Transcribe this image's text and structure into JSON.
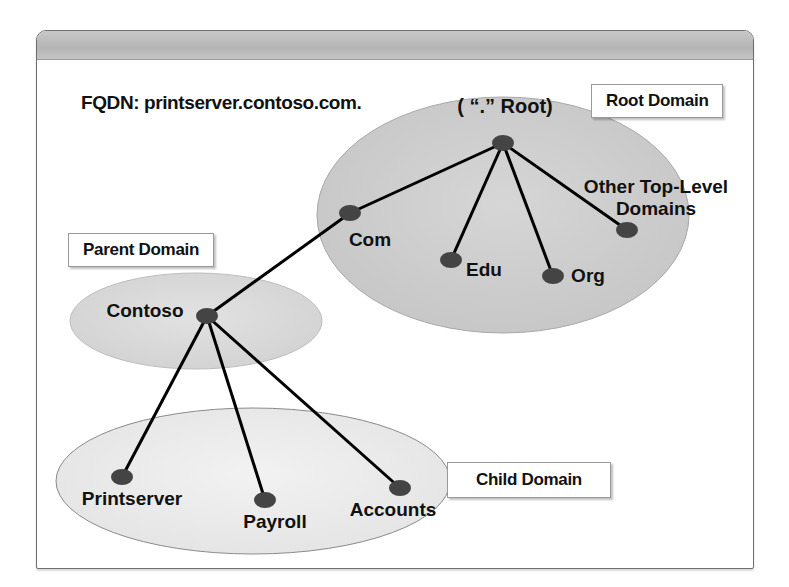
{
  "fqdn_label": "FQDN: printserver.contoso.com.",
  "tags": {
    "root_domain": "Root Domain",
    "parent_domain": "Parent Domain",
    "child_domain": "Child Domain"
  },
  "colors": {
    "root_ellipse": "#cfcfcf",
    "parent_ellipse": "#dcdcdc",
    "child_ellipse": "#ececec",
    "node": "#444444",
    "edge": "#000000",
    "header_bar": "#bdbdbd"
  },
  "nodes": [
    {
      "id": "root",
      "label": "( “.” Root)"
    },
    {
      "id": "com",
      "label": "Com"
    },
    {
      "id": "edu",
      "label": "Edu"
    },
    {
      "id": "org",
      "label": "Org"
    },
    {
      "id": "other",
      "label": "Other Top-Level",
      "label2": "Domains"
    },
    {
      "id": "contoso",
      "label": "Contoso"
    },
    {
      "id": "printserver",
      "label": "Printserver"
    },
    {
      "id": "payroll",
      "label": "Payroll"
    },
    {
      "id": "accounts",
      "label": "Accounts"
    }
  ],
  "edges": [
    [
      "root",
      "com"
    ],
    [
      "root",
      "edu"
    ],
    [
      "root",
      "org"
    ],
    [
      "root",
      "other"
    ],
    [
      "com",
      "contoso"
    ],
    [
      "contoso",
      "printserver"
    ],
    [
      "contoso",
      "payroll"
    ],
    [
      "contoso",
      "accounts"
    ]
  ]
}
